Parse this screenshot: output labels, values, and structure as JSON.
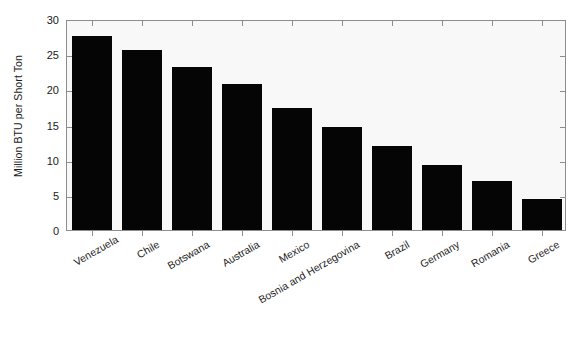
{
  "chart_data": {
    "type": "bar",
    "title": "",
    "xlabel": "",
    "ylabel": "Million BTU per Short Ton",
    "ylim": [
      0,
      30
    ],
    "yticks": [
      0,
      5,
      10,
      15,
      20,
      25,
      30
    ],
    "ytick_labels": [
      "0",
      "5",
      "10",
      "15",
      "20",
      "25",
      "30"
    ],
    "grid": false,
    "legend": null,
    "bar_color": "#050505",
    "plot_background": "#f8f8f8",
    "axis_color": "#8d8d8d",
    "categories": [
      "Venezuela",
      "Chile",
      "Botswana",
      "Australia",
      "Mexico",
      "Bosnia and Herzegovina",
      "Brazil",
      "Germany",
      "Romania",
      "Greece"
    ],
    "values": [
      27.6,
      25.6,
      23.2,
      20.7,
      17.4,
      14.7,
      12.0,
      9.3,
      6.9,
      4.4
    ]
  }
}
